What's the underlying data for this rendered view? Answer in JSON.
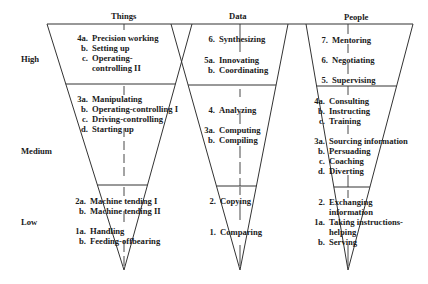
{
  "columns": [
    {
      "id": "things",
      "title": "Things",
      "groups": {
        "high": [
          {
            "num": "4a.",
            "label": "Precision working"
          },
          {
            "num": "b.",
            "label": "Setting up"
          },
          {
            "num": "c.",
            "label": "Operating-"
          },
          {
            "num": "",
            "label": "controlling II"
          }
        ],
        "medium": [
          {
            "num": "3a.",
            "label": "Manipulating"
          },
          {
            "num": "b.",
            "label": "Operating-controlling I"
          },
          {
            "num": "c.",
            "label": "Driving-controlling"
          },
          {
            "num": "d.",
            "label": "Starting up"
          }
        ],
        "low": [
          {
            "num": "2a.",
            "label": "Machine tending I"
          },
          {
            "num": "b.",
            "label": "Machine tending II"
          },
          {
            "num": "1a.",
            "label": "Handling"
          },
          {
            "num": "b.",
            "label": "Feeding-offbearing"
          }
        ]
      }
    },
    {
      "id": "data",
      "title": "Data",
      "groups": {
        "high": [
          {
            "num": "6.",
            "label": "Synthesizing"
          },
          {
            "num": "5a.",
            "label": "Innovating"
          },
          {
            "num": "b.",
            "label": "Coordinating"
          }
        ],
        "medium": [
          {
            "num": "4.",
            "label": "Analyzing"
          },
          {
            "num": "3a.",
            "label": "Computing"
          },
          {
            "num": "b.",
            "label": "Compiling"
          }
        ],
        "low": [
          {
            "num": "2.",
            "label": "Copying"
          },
          {
            "num": "1.",
            "label": "Comparing"
          }
        ]
      }
    },
    {
      "id": "people",
      "title": "People",
      "groups": {
        "high": [
          {
            "num": "7.",
            "label": "Mentoring"
          },
          {
            "num": "6.",
            "label": "Negotiating"
          },
          {
            "num": "5.",
            "label": "Supervising"
          }
        ],
        "medium": [
          {
            "num": "4a.",
            "label": "Consulting"
          },
          {
            "num": "b.",
            "label": "Instructing"
          },
          {
            "num": "c.",
            "label": "Training"
          },
          {
            "num": "3a.",
            "label": "Sourcing information"
          },
          {
            "num": "b.",
            "label": "Persuading"
          },
          {
            "num": "c.",
            "label": "Coaching"
          },
          {
            "num": "d.",
            "label": "Diverting"
          }
        ],
        "low": [
          {
            "num": "2.",
            "label": "Exchanging"
          },
          {
            "num": "",
            "label": "information"
          },
          {
            "num": "1a.",
            "label": "Taking instructions-"
          },
          {
            "num": "",
            "label": "helping"
          },
          {
            "num": "b.",
            "label": "Serving"
          }
        ]
      }
    }
  ],
  "levels": {
    "high": "High",
    "medium": "Medium",
    "low": "Low"
  },
  "colors": {
    "line": "#333333",
    "text": "#1a1a1a"
  }
}
